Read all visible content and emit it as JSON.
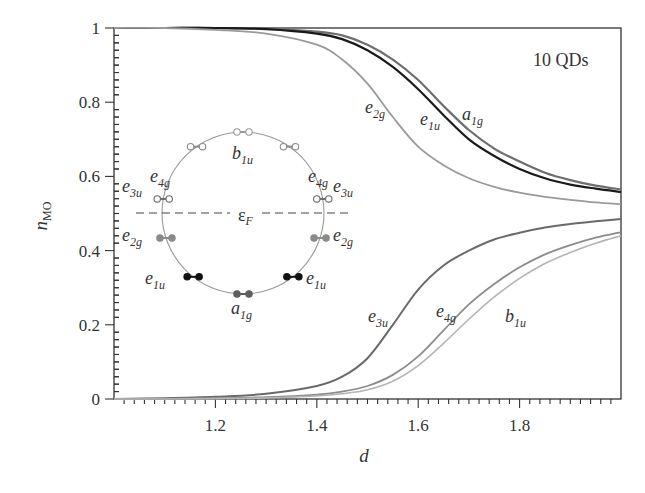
{
  "chart_data": {
    "type": "line",
    "title": "",
    "annotation": "10 QDs",
    "xlabel": "d",
    "ylabel": "n_MO",
    "ylabel_main": "n",
    "ylabel_sub": "MO",
    "xlim": [
      1.0,
      2.0
    ],
    "ylim": [
      0,
      1
    ],
    "grid": false,
    "legend": "none (inline curve labels)",
    "x_ticks": [
      "1.2",
      "1.4",
      "1.6",
      "1.8"
    ],
    "x_tick_values": [
      1.2,
      1.4,
      1.6,
      1.8
    ],
    "y_ticks": [
      "0",
      "0.2",
      "0.4",
      "0.6",
      "0.8",
      "1"
    ],
    "y_tick_values": [
      0,
      0.2,
      0.4,
      0.6,
      0.8,
      1.0
    ],
    "x": [
      1.0,
      1.1,
      1.2,
      1.3,
      1.4,
      1.45,
      1.5,
      1.55,
      1.6,
      1.65,
      1.7,
      1.75,
      1.8,
      1.85,
      1.9,
      1.95,
      2.0
    ],
    "series": [
      {
        "name": "a1g",
        "label_main": "a",
        "label_sub": "1g",
        "color": "#6e6e6e",
        "width": 2.2,
        "values": [
          1.0,
          1.0,
          1.0,
          0.998,
          0.99,
          0.98,
          0.955,
          0.915,
          0.86,
          0.79,
          0.725,
          0.675,
          0.64,
          0.61,
          0.59,
          0.575,
          0.565
        ]
      },
      {
        "name": "e1u",
        "label_main": "e",
        "label_sub": "1u",
        "color": "#1a1a1a",
        "width": 2.2,
        "values": [
          1.0,
          1.0,
          1.0,
          0.997,
          0.985,
          0.97,
          0.94,
          0.895,
          0.835,
          0.765,
          0.7,
          0.655,
          0.62,
          0.595,
          0.578,
          0.567,
          0.558
        ]
      },
      {
        "name": "e2g",
        "label_main": "e",
        "label_sub": "2g",
        "color": "#9a9a9a",
        "width": 1.8,
        "values": [
          1.0,
          1.0,
          0.995,
          0.985,
          0.955,
          0.915,
          0.85,
          0.76,
          0.68,
          0.63,
          0.595,
          0.572,
          0.556,
          0.545,
          0.537,
          0.53,
          0.525
        ]
      },
      {
        "name": "e3u",
        "label_main": "e",
        "label_sub": "3u",
        "color": "#6a6a6a",
        "width": 2.0,
        "values": [
          0.0,
          0.002,
          0.006,
          0.014,
          0.035,
          0.06,
          0.11,
          0.2,
          0.295,
          0.36,
          0.4,
          0.43,
          0.448,
          0.462,
          0.472,
          0.479,
          0.485
        ]
      },
      {
        "name": "e4g",
        "label_main": "e",
        "label_sub": "4g",
        "color": "#8c8c8c",
        "width": 1.8,
        "values": [
          0.0,
          0.0,
          0.002,
          0.005,
          0.012,
          0.02,
          0.035,
          0.065,
          0.115,
          0.185,
          0.255,
          0.31,
          0.355,
          0.39,
          0.415,
          0.435,
          0.45
        ]
      },
      {
        "name": "b1u",
        "label_main": "b",
        "label_sub": "1u",
        "color": "#b4b4b4",
        "width": 1.6,
        "values": [
          0.0,
          0.0,
          0.001,
          0.003,
          0.008,
          0.014,
          0.025,
          0.048,
          0.09,
          0.15,
          0.215,
          0.275,
          0.325,
          0.365,
          0.395,
          0.42,
          0.44
        ]
      }
    ],
    "inset": {
      "description": "Molecular orbital energy level ring diagram",
      "fermi_label_main": "ε",
      "fermi_label_sub": "F",
      "levels": [
        {
          "name": "b1u",
          "main": "b",
          "sub": "1u",
          "filled": false,
          "color": "#9a9a9a"
        },
        {
          "name": "e4g",
          "main": "e",
          "sub": "4g",
          "filled": false,
          "color": "#8c8c8c"
        },
        {
          "name": "e3u",
          "main": "e",
          "sub": "3u",
          "filled": false,
          "color": "#6a6a6a"
        },
        {
          "name": "e2g",
          "main": "e",
          "sub": "2g",
          "filled": true,
          "color": "#8a8a8a"
        },
        {
          "name": "e1u",
          "main": "e",
          "sub": "1u",
          "filled": true,
          "color": "#111111"
        },
        {
          "name": "a1g",
          "main": "a",
          "sub": "1g",
          "filled": true,
          "color": "#5e5e5e"
        }
      ]
    }
  },
  "labels": {
    "annotation": "10 QDs",
    "xlabel": "d",
    "ylabel_main": "n",
    "ylabel_sub": "MO"
  }
}
